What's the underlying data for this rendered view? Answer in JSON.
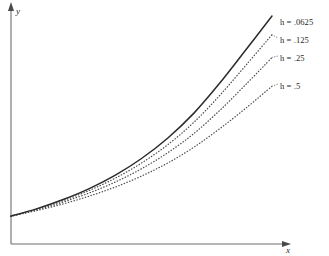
{
  "figure": {
    "background_color": "#ffffff",
    "axis_color": "#6e6e6e",
    "solid_curve_color": "#2b2b2b",
    "dotted_curve_color": "#4d4d4d"
  },
  "axes": {
    "y_label": "y",
    "x_label": "x"
  },
  "legend": {
    "items": [
      {
        "label": "h = .0625",
        "symbol": "h",
        "value": ".0625",
        "style": "solid"
      },
      {
        "label": "h = .125",
        "symbol": "h",
        "value": ".125",
        "style": "dotted"
      },
      {
        "label": "h = .25",
        "symbol": "h",
        "value": ".25",
        "style": "dotted"
      },
      {
        "label": "h = .5",
        "symbol": "h",
        "value": ".5",
        "style": "dotted"
      }
    ]
  },
  "chart_data": {
    "type": "line",
    "title": "",
    "subtitle": "",
    "xlabel": "x",
    "ylabel": "y",
    "xlim": [
      0,
      1
    ],
    "ylim": [
      0,
      1
    ],
    "grid": false,
    "legend_position": "right-inside",
    "axis_ticks": {
      "x": [],
      "y": []
    },
    "annotations": [
      "h = .0625",
      "h = .125",
      "h = .25",
      "h = .5"
    ],
    "x": [
      0.0,
      0.1,
      0.2,
      0.3,
      0.4,
      0.5,
      0.6,
      0.7,
      0.8,
      0.9,
      1.0
    ],
    "series": [
      {
        "name": "h = .0625",
        "style": "solid",
        "values": [
          0.122,
          0.155,
          0.195,
          0.243,
          0.302,
          0.375,
          0.464,
          0.573,
          0.706,
          0.852,
          1.0
        ]
      },
      {
        "name": "h = .125",
        "style": "dotted",
        "values": [
          0.122,
          0.153,
          0.19,
          0.235,
          0.289,
          0.355,
          0.435,
          0.533,
          0.652,
          0.784,
          0.918
        ]
      },
      {
        "name": "h = .25",
        "style": "dotted",
        "values": [
          0.122,
          0.15,
          0.184,
          0.224,
          0.272,
          0.33,
          0.4,
          0.484,
          0.586,
          0.7,
          0.818
        ]
      },
      {
        "name": "h = .5",
        "style": "dotted",
        "values": [
          0.122,
          0.147,
          0.176,
          0.21,
          0.25,
          0.298,
          0.355,
          0.424,
          0.506,
          0.596,
          0.692
        ]
      }
    ]
  }
}
